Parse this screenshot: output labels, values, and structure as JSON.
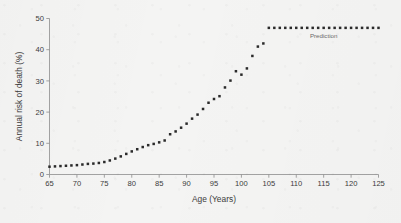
{
  "chart_data": {
    "type": "scatter",
    "title": "",
    "xlabel": "Age (Years)",
    "ylabel": "Annual risk of death (%)",
    "xlim": [
      65,
      125
    ],
    "ylim": [
      0,
      50
    ],
    "xticks": [
      65,
      70,
      75,
      80,
      85,
      90,
      95,
      100,
      105,
      110,
      115,
      120,
      125
    ],
    "yticks": [
      0,
      10,
      20,
      30,
      40,
      50
    ],
    "xtick_labels": [
      "65",
      "70",
      "75",
      "80",
      "85",
      "90",
      "95",
      "100",
      "105",
      "110",
      "115",
      "120",
      "125"
    ],
    "ytick_labels": [
      "0",
      "10",
      "20",
      "30",
      "40",
      "50"
    ],
    "grid": false,
    "legend_position": "inline-annotation",
    "marker_color": "#2a2a2a",
    "axis_color": "#8d8d8d",
    "background_color": "#f4f4f3",
    "series": [
      {
        "name": "Observed",
        "annotation": "",
        "marker": "square",
        "x": [
          65,
          66,
          67,
          68,
          69,
          70,
          71,
          72,
          73,
          74,
          75,
          76,
          77,
          78,
          79,
          80,
          81,
          82,
          83,
          84,
          85,
          86,
          87,
          88,
          89,
          90,
          91,
          92,
          93,
          94,
          95,
          96,
          97,
          98,
          99,
          100,
          101,
          102,
          103,
          104
        ],
        "values": [
          2.5,
          2.6,
          2.7,
          2.8,
          2.9,
          3.0,
          3.2,
          3.4,
          3.5,
          3.7,
          4.0,
          4.5,
          5.1,
          5.8,
          6.6,
          7.4,
          8.1,
          8.8,
          9.4,
          9.8,
          10.3,
          10.9,
          12.9,
          13.8,
          15.0,
          16.3,
          17.9,
          19.2,
          21.0,
          23.0,
          24.2,
          25.1,
          27.9,
          30.1,
          33.1,
          32.0,
          34.0,
          38.0,
          41.0,
          42.0
        ]
      },
      {
        "name": "Prediction",
        "annotation": "Prediction",
        "marker": "square",
        "x": [
          105,
          106,
          107,
          108,
          109,
          110,
          111,
          112,
          113,
          114,
          115,
          116,
          117,
          118,
          119,
          120,
          121,
          122,
          123,
          124,
          125
        ],
        "values": [
          47,
          47,
          47,
          47,
          47,
          47,
          47,
          47,
          47,
          47,
          47,
          47,
          47,
          47,
          47,
          47,
          47,
          47,
          47,
          47,
          47
        ]
      }
    ]
  }
}
